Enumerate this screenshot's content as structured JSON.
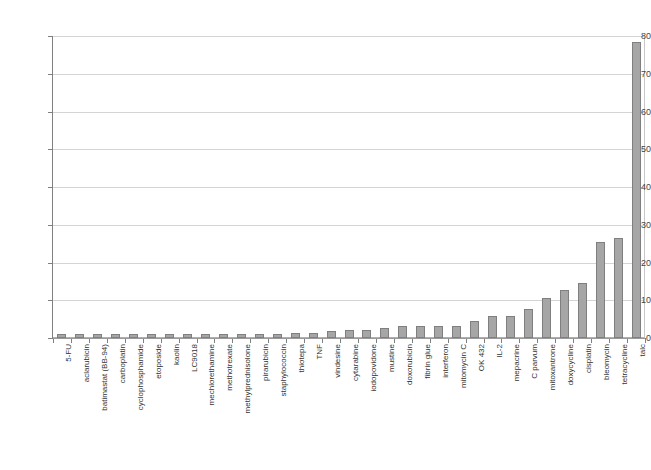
{
  "chart_data": {
    "type": "bar",
    "title": "",
    "subtitle": "",
    "xlabel": "",
    "ylabel": "",
    "ylim": [
      0,
      80
    ],
    "yticks": [
      0,
      10,
      20,
      30,
      40,
      50,
      60,
      70,
      80
    ],
    "ytick_labels": [
      "0",
      "10",
      "20",
      "30",
      "40",
      "50",
      "60",
      "70",
      "80"
    ],
    "grid": true,
    "legend": false,
    "legend_position": "none",
    "bar_color": "#a6a6a6",
    "bar_border_color": "#7f7f7f",
    "categories": [
      "5-FU",
      "aclarubicin",
      "batimastat (BB-94)",
      "carboplatin",
      "cyclophosphamide",
      "etoposide",
      "kaolin",
      "LC9018",
      "mechlorethamine",
      "methotrexate",
      "methylprednisolone",
      "pirarubicin",
      "staphylococcin",
      "thiotepa",
      "TNF",
      "vindesine",
      "cytarabine",
      "iodopovidone",
      "mustine",
      "doxorubicin",
      "fibrin glue",
      "interferon",
      "mitomycin C",
      "OK 432",
      "IL-2",
      "mepacrine",
      "C parvum",
      "mitoxantrone",
      "doxycycline",
      "cisplatin",
      "bleomycin",
      "tetracycline",
      "talc"
    ],
    "values": [
      1.0,
      1.0,
      1.0,
      1.0,
      1.0,
      1.0,
      1.0,
      1.0,
      1.0,
      1.0,
      1.0,
      1.1,
      1.1,
      1.2,
      1.3,
      1.9,
      2.0,
      2.0,
      2.6,
      3.2,
      3.2,
      3.2,
      3.3,
      4.6,
      5.8,
      5.8,
      7.7,
      10.7,
      12.7,
      14.7,
      25.5,
      26.5,
      78.3
    ]
  }
}
